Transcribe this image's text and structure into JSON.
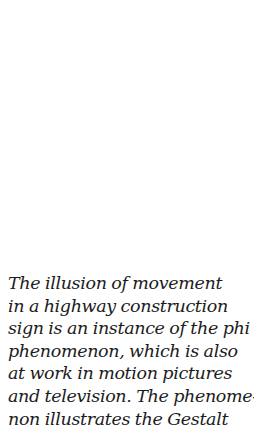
{
  "caption": {
    "lines": [
      "The illusion of movement",
      "in a highway construction",
      "sign is an instance of the phi",
      "phenomenon, which is also",
      "at work in motion pictures",
      "and television. The phenome-",
      "non illustrates the Gestalt"
    ]
  },
  "colors": {
    "background": "#ffffff",
    "text": "#1c1c1c"
  }
}
